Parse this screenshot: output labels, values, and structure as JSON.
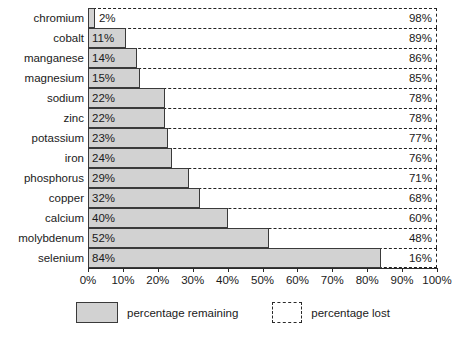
{
  "chart_data": {
    "type": "bar",
    "title": "",
    "subtitle": "",
    "xlabel": "",
    "ylabel": "",
    "orientation": "horizontal",
    "stacked": true,
    "grid": false,
    "xlim": [
      0,
      100
    ],
    "xticks": [
      "0%",
      "10%",
      "20%",
      "30%",
      "40%",
      "50%",
      "60%",
      "70%",
      "80%",
      "90%",
      "100%"
    ],
    "xtick_values": [
      0,
      10,
      20,
      30,
      40,
      50,
      60,
      70,
      80,
      90,
      100
    ],
    "categories": [
      "chromium",
      "cobalt",
      "manganese",
      "magnesium",
      "sodium",
      "zinc",
      "potassium",
      "iron",
      "phosphorus",
      "copper",
      "calcium",
      "molybdenum",
      "selenium"
    ],
    "series": [
      {
        "name": "percentage remaining",
        "values": [
          2,
          11,
          14,
          15,
          22,
          22,
          23,
          24,
          29,
          32,
          40,
          52,
          84
        ],
        "labels": [
          "2%",
          "11%",
          "14%",
          "15%",
          "22%",
          "22%",
          "23%",
          "24%",
          "29%",
          "32%",
          "40%",
          "52%",
          "84%"
        ],
        "color": "#d2d2d2",
        "border_color": "#3a3a3a",
        "style": "solid"
      },
      {
        "name": "percentage lost",
        "values": [
          98,
          89,
          86,
          85,
          78,
          78,
          77,
          76,
          71,
          68,
          60,
          48,
          16
        ],
        "labels": [
          "98%",
          "89%",
          "86%",
          "85%",
          "78%",
          "78%",
          "77%",
          "76%",
          "71%",
          "68%",
          "60%",
          "48%",
          "16%"
        ],
        "color": "#ffffff",
        "border_color": "#2a2a2a",
        "style": "dashed"
      }
    ],
    "rows": [
      {
        "category": "chromium",
        "remaining": 2,
        "remaining_label": "2%",
        "lost": 98,
        "lost_label": "98%"
      },
      {
        "category": "cobalt",
        "remaining": 11,
        "remaining_label": "11%",
        "lost": 89,
        "lost_label": "89%"
      },
      {
        "category": "manganese",
        "remaining": 14,
        "remaining_label": "14%",
        "lost": 86,
        "lost_label": "86%"
      },
      {
        "category": "magnesium",
        "remaining": 15,
        "remaining_label": "15%",
        "lost": 85,
        "lost_label": "85%"
      },
      {
        "category": "sodium",
        "remaining": 22,
        "remaining_label": "22%",
        "lost": 78,
        "lost_label": "78%"
      },
      {
        "category": "zinc",
        "remaining": 22,
        "remaining_label": "22%",
        "lost": 78,
        "lost_label": "78%"
      },
      {
        "category": "potassium",
        "remaining": 23,
        "remaining_label": "23%",
        "lost": 77,
        "lost_label": "77%"
      },
      {
        "category": "iron",
        "remaining": 24,
        "remaining_label": "24%",
        "lost": 76,
        "lost_label": "76%"
      },
      {
        "category": "phosphorus",
        "remaining": 29,
        "remaining_label": "29%",
        "lost": 71,
        "lost_label": "71%"
      },
      {
        "category": "copper",
        "remaining": 32,
        "remaining_label": "32%",
        "lost": 68,
        "lost_label": "68%"
      },
      {
        "category": "calcium",
        "remaining": 40,
        "remaining_label": "40%",
        "lost": 60,
        "lost_label": "60%"
      },
      {
        "category": "molybdenum",
        "remaining": 52,
        "remaining_label": "52%",
        "lost": 48,
        "lost_label": "48%"
      },
      {
        "category": "selenium",
        "remaining": 84,
        "remaining_label": "84%",
        "lost": 16,
        "lost_label": "16%"
      }
    ],
    "legend": {
      "position": "bottom",
      "entries": [
        {
          "label": "percentage remaining",
          "swatch": "solid-gray"
        },
        {
          "label": "percentage lost",
          "swatch": "dashed-outline"
        }
      ]
    }
  }
}
